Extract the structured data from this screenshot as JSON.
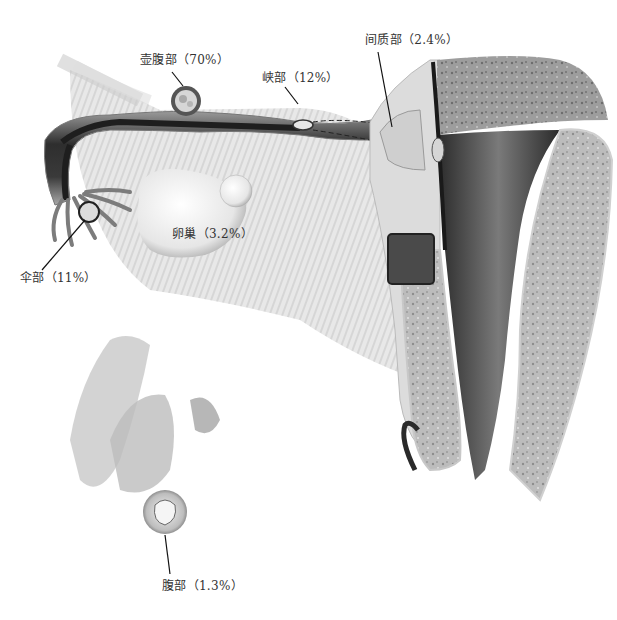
{
  "figure": {
    "labels": [
      {
        "id": "ampulla",
        "text": "壶腹部（70%）",
        "region": "ampulla"
      },
      {
        "id": "isthmus",
        "text": "峡部（12%）",
        "region": "isthmus"
      },
      {
        "id": "interstitial",
        "text": "间质部（2.4%）",
        "region": "interstitial"
      },
      {
        "id": "ovary",
        "text": "卵巢（3.2%）",
        "region": "ovary"
      },
      {
        "id": "fimbria",
        "text": "伞部（11%）",
        "region": "fimbria"
      },
      {
        "id": "abdominal",
        "text": "腹部（1.3%）",
        "region": "abdominal"
      }
    ],
    "caption": "",
    "colors": {
      "tube_dark": "#2e2e2e",
      "tube_mid": "#8a8a8a",
      "tissue_light": "#d9d9d9",
      "uterus_wall": "#9a9a9a",
      "cavity_dark": "#3a3a3a",
      "leader_line": "#111111",
      "label_text": "#333333"
    }
  }
}
